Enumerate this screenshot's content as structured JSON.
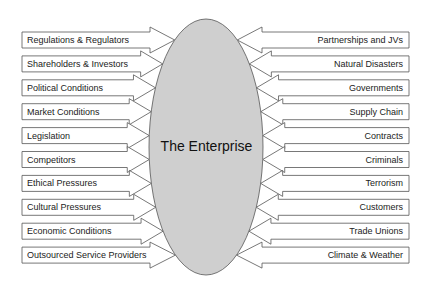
{
  "diagram": {
    "center_label": "The Enterprise",
    "colors": {
      "ellipse_fill": "#cfcfcf",
      "stroke": "#555555",
      "box_fill": "#ffffff"
    },
    "left_factors": [
      "Regulations & Regulators",
      "Shareholders & Investors",
      "Political Conditions",
      "Market Conditions",
      "Legislation",
      "Competitors",
      "Ethical Pressures",
      "Cultural Pressures",
      "Economic Conditions",
      "Outsourced Service Providers"
    ],
    "right_factors": [
      "Partnerships and JVs",
      "Natural Disasters",
      "Governments",
      "Supply Chain",
      "Contracts",
      "Criminals",
      "Terrorism",
      "Customers",
      "Trade Unions",
      "Climate & Weather"
    ]
  }
}
